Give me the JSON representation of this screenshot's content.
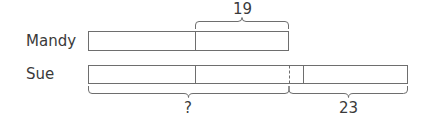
{
  "diagram": {
    "type": "bar-model",
    "rows": [
      {
        "name": "Mandy",
        "segments": [
          "unit",
          "unit"
        ]
      },
      {
        "name": "Sue",
        "segments": [
          "unit",
          "unit",
          "gap",
          "extra"
        ]
      }
    ],
    "labels": {
      "mandy": "Mandy",
      "sue": "Sue",
      "top_brace": "19",
      "bottom_left_brace": "?",
      "bottom_right_brace": "23"
    },
    "colors": {
      "stroke": "#6e6e6e",
      "text": "#3a3a3a",
      "background": "#ffffff"
    }
  }
}
